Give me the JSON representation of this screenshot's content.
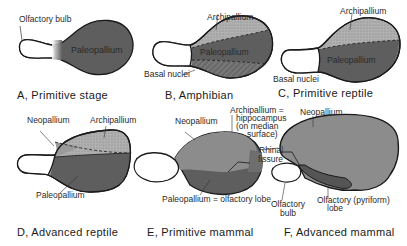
{
  "panels": [
    {
      "id": "A",
      "caption": "A,  Primitive stage",
      "labels": {
        "olfactory_bulb": "Olfactory bulb",
        "paleopallium": "Paleopallium"
      }
    },
    {
      "id": "B",
      "caption": "B,  Amphibian",
      "labels": {
        "archipallium": "Archipallium",
        "paleopallium": "Paleopallium",
        "basal_nuclei": "Basal nuclei"
      }
    },
    {
      "id": "C",
      "caption": "C,  Primitive reptile",
      "labels": {
        "archipallium": "Archipallium",
        "paleopallium": "Paleopallium",
        "basal_nuclei": "Basal nuclei"
      }
    },
    {
      "id": "D",
      "caption": "D,  Advanced reptile",
      "labels": {
        "neopallium": "Neopallium",
        "archipallium": "Archipallium",
        "paleopallium": "Paleopallium"
      }
    },
    {
      "id": "E",
      "caption": "E,  Primitive mammal",
      "labels": {
        "neopallium": "Neopallium",
        "archipallium_1": "Archipallium =",
        "archipallium_2": "hippocampus",
        "archipallium_3": "(on median",
        "archipallium_4": "surface)",
        "rhinal_1": "Rhinal",
        "rhinal_2": "fissure",
        "paleopallium": "Paleopallium = olfactory lobe"
      }
    },
    {
      "id": "F",
      "caption": "F,  Advanced mammal",
      "labels": {
        "neopallium": "Neopallium",
        "olfactory_bulb_1": "Olfactory",
        "olfactory_bulb_2": "bulb",
        "olfactory_lobe_1": "Olfactory (pyriform)",
        "olfactory_lobe_2": "lobe"
      }
    }
  ],
  "colors": {
    "paleopallium": "#5e5e5e",
    "archipallium": "#a8a8a8",
    "neopallium": "#8c8c8c",
    "outline": "#1a1a1a",
    "bulb": "#ffffff"
  }
}
